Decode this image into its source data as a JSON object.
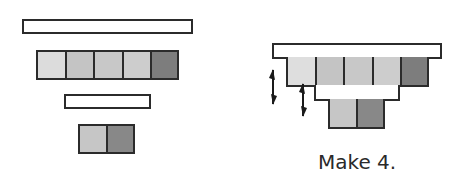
{
  "colors": {
    "outline": "#2b2b2b",
    "light": "#dcdcdc",
    "medium": "#c4c4c4",
    "dark": "#7d7d7d",
    "bar_fill": "#ffffff"
  },
  "left_diagram": {
    "top_bar": {
      "label": "long rod"
    },
    "row_five": {
      "cells": [
        {
          "shade": "light",
          "color": "#dcdcdc"
        },
        {
          "shade": "medium",
          "color": "#c4c4c4"
        },
        {
          "shade": "medium",
          "color": "#c8c8c8"
        },
        {
          "shade": "medium",
          "color": "#cdcdcd"
        },
        {
          "shade": "dark",
          "color": "#7d7d7d"
        }
      ]
    },
    "mid_bar": {
      "label": "short rod"
    },
    "row_two": {
      "cells": [
        {
          "shade": "medium",
          "color": "#c6c6c6"
        },
        {
          "shade": "dark",
          "color": "#888888"
        }
      ]
    }
  },
  "right_diagram": {
    "top_bar": {
      "label": "long rod"
    },
    "row_five": {
      "cells": [
        {
          "shade": "light",
          "color": "#dedede"
        },
        {
          "shade": "medium",
          "color": "#c4c4c4"
        },
        {
          "shade": "medium",
          "color": "#c8c8c8"
        },
        {
          "shade": "medium",
          "color": "#cdcdcd"
        },
        {
          "shade": "dark",
          "color": "#7d7d7d"
        }
      ]
    },
    "row_two": {
      "cells": [
        {
          "shade": "medium",
          "color": "#c6c6c6"
        },
        {
          "shade": "dark",
          "color": "#888888"
        }
      ]
    },
    "arrows": [
      "double-arrow-icon",
      "double-arrow-icon"
    ],
    "caption": "Make 4."
  }
}
